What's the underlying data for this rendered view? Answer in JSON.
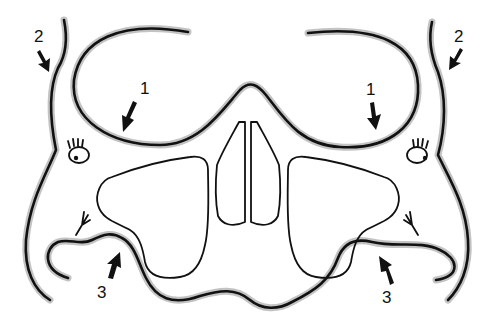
{
  "diagram": {
    "labels": [
      {
        "id": "label-1-left",
        "text": "1",
        "x": 140,
        "y": 94
      },
      {
        "id": "label-1-right",
        "text": "1",
        "x": 368,
        "y": 94
      },
      {
        "id": "label-2-left",
        "text": "2",
        "x": 34,
        "y": 40
      },
      {
        "id": "label-2-right",
        "text": "2",
        "x": 456,
        "y": 40
      },
      {
        "id": "label-3-left",
        "text": "3",
        "x": 99,
        "y": 298
      },
      {
        "id": "label-3-right",
        "text": "3",
        "x": 386,
        "y": 302
      }
    ],
    "colors": {
      "stroke": "#111111",
      "halo": "#b8b8b8",
      "background": "#ffffff"
    }
  }
}
